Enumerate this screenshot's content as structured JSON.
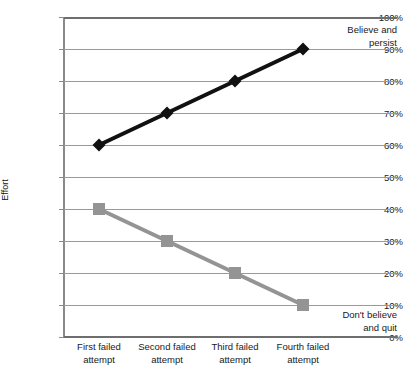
{
  "chart_data": {
    "type": "line",
    "title": "",
    "xlabel": "",
    "ylabel": "Effort",
    "ylim": [
      0,
      100
    ],
    "grid": true,
    "legend_position": "none",
    "categories": [
      "First failed attempt",
      "Second failed attempt",
      "Third failed attempt",
      "Fourth failed attempt"
    ],
    "y_tick_labels": [
      "100%",
      "90%",
      "80%",
      "70%",
      "60%",
      "50%",
      "40%",
      "30%",
      "20%",
      "10%",
      "0%"
    ],
    "y_tick_values": [
      100,
      90,
      80,
      70,
      60,
      50,
      40,
      30,
      20,
      10,
      0
    ],
    "series": [
      {
        "name": "Believe and persist",
        "values": [
          60,
          70,
          80,
          90
        ],
        "color": "#111111",
        "marker": "diamond"
      },
      {
        "name": "Don't believe and quit",
        "values": [
          40,
          30,
          20,
          10
        ],
        "color": "#949494",
        "marker": "square"
      }
    ],
    "annotations": [
      {
        "id": "believe",
        "line1": "Believe and",
        "line2": "persist"
      },
      {
        "id": "quit",
        "line1": "Don't believe",
        "line2": "and quit"
      }
    ]
  },
  "axis": {
    "y_title": "Effort"
  },
  "categories_split": [
    {
      "line1": "First failed",
      "line2": "attempt"
    },
    {
      "line1": "Second failed",
      "line2": "attempt"
    },
    {
      "line1": "Third failed",
      "line2": "attempt"
    },
    {
      "line1": "Fourth failed",
      "line2": "attempt"
    }
  ],
  "colors": {
    "series_persist": "#111111",
    "series_quit": "#949494",
    "gridline": "#9a9a9a",
    "axis": "#6e6e6e",
    "background": "#ffffff"
  }
}
